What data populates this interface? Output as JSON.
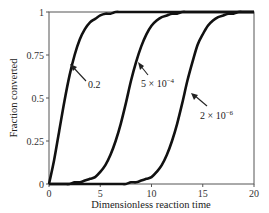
{
  "chart_data": {
    "type": "line",
    "title": "",
    "xlabel": "Dimensionless reaction time",
    "ylabel": "Fraction converted",
    "xlim": [
      0,
      20
    ],
    "ylim": [
      0,
      1
    ],
    "xticks": [
      0,
      5,
      10,
      15,
      20
    ],
    "xtick_labels": [
      "0",
      "5",
      "10",
      "15",
      "20"
    ],
    "yticks": [
      0,
      0.25,
      0.5,
      0.75,
      1
    ],
    "ytick_labels": [
      "0",
      "0.25",
      "0.5",
      "0.75",
      "1"
    ],
    "grid": false,
    "legend": "none (curves annotated with arrows)",
    "x": [
      0,
      0.5,
      1,
      1.5,
      2,
      2.5,
      3,
      3.5,
      4,
      4.5,
      5,
      5.5,
      6,
      6.5,
      7,
      7.5,
      8,
      8.5,
      9,
      9.5,
      10,
      10.5,
      11,
      11.5,
      12,
      12.5,
      13,
      13.5,
      14,
      14.5,
      15,
      15.5,
      16,
      16.5,
      17,
      17.5,
      18,
      18.5,
      19,
      19.5,
      20
    ],
    "series": [
      {
        "name": "0.2",
        "values": [
          0,
          0.14,
          0.31,
          0.48,
          0.63,
          0.75,
          0.84,
          0.9,
          0.94,
          0.96,
          0.98,
          0.99,
          0.99,
          1,
          1,
          1,
          1,
          1,
          1,
          1,
          1,
          1,
          1,
          1,
          1,
          1,
          1,
          1,
          1,
          1,
          1,
          1,
          1,
          1,
          1,
          1,
          1,
          1,
          1,
          1,
          1
        ]
      },
      {
        "name": "5 × 10^-4",
        "values": [
          0,
          0,
          0,
          0,
          0,
          0.01,
          0.01,
          0.02,
          0.03,
          0.04,
          0.07,
          0.11,
          0.17,
          0.25,
          0.35,
          0.47,
          0.6,
          0.71,
          0.8,
          0.87,
          0.92,
          0.95,
          0.97,
          0.98,
          0.99,
          0.99,
          1,
          1,
          1,
          1,
          1,
          1,
          1,
          1,
          1,
          1,
          1,
          1,
          1,
          1,
          1
        ]
      },
      {
        "name": "2 × 10^-6",
        "values": [
          0,
          0,
          0,
          0,
          0,
          0,
          0,
          0,
          0,
          0,
          0,
          0,
          0,
          0,
          0,
          0,
          0.01,
          0.01,
          0.02,
          0.03,
          0.04,
          0.07,
          0.11,
          0.17,
          0.25,
          0.35,
          0.47,
          0.6,
          0.71,
          0.81,
          0.87,
          0.92,
          0.95,
          0.97,
          0.98,
          0.99,
          0.99,
          1,
          1,
          1,
          1
        ]
      }
    ],
    "annotations": [
      {
        "text": "0.2",
        "arrow_to": [
          1.9,
          0.7
        ]
      },
      {
        "text": "5 × 10^-4",
        "arrow_to": [
          8.2,
          0.7
        ]
      },
      {
        "text": "2 × 10^-6",
        "arrow_to": [
          14.2,
          0.62
        ]
      }
    ]
  },
  "labels": {
    "xlabel": "Dimensionless reaction time",
    "ylabel": "Fraction converted",
    "annot1": "0.2",
    "annot2_base": "5 × 10",
    "annot2_exp": "−4",
    "annot3_base": "2 × 10",
    "annot3_exp": "−6"
  }
}
